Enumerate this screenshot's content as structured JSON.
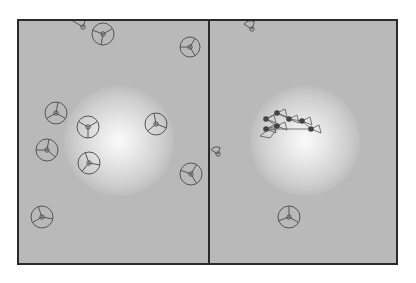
{
  "figure": {
    "background": "#ffffff",
    "panel_fill": "#b9b9b9",
    "border_color": "#2a2a2a",
    "agent_stroke": "#555555",
    "agent_dot": "#444444",
    "panels": [
      {
        "name": "left",
        "light_center": [
          100,
          120
        ],
        "agents": [
          {
            "x": 64,
            "y": 6,
            "r": 11,
            "type": "fan"
          },
          {
            "x": 84,
            "y": 13,
            "r": 11,
            "type": "circle",
            "angles": [
              200,
              100,
              330
            ]
          },
          {
            "x": 171,
            "y": 26,
            "r": 10,
            "type": "circle",
            "angles": [
              60,
              180,
              300
            ]
          },
          {
            "x": 37,
            "y": 92,
            "r": 11,
            "type": "circle",
            "angles": [
              30,
              150,
              280
            ]
          },
          {
            "x": 69,
            "y": 106,
            "r": 11,
            "type": "circle",
            "angles": [
              90,
              210,
              330
            ]
          },
          {
            "x": 137,
            "y": 103,
            "r": 11,
            "type": "circle",
            "angles": [
              20,
              140,
              260
            ]
          },
          {
            "x": 28,
            "y": 129,
            "r": 11,
            "type": "circle",
            "angles": [
              40,
              180,
              280
            ]
          },
          {
            "x": 70,
            "y": 142,
            "r": 11,
            "type": "circle",
            "angles": [
              10,
              130,
              250
            ]
          },
          {
            "x": 172,
            "y": 153,
            "r": 11,
            "type": "circle",
            "angles": [
              60,
              200,
              300
            ]
          },
          {
            "x": 23,
            "y": 196,
            "r": 11,
            "type": "circle",
            "angles": [
              10,
              150,
              250
            ]
          }
        ]
      },
      {
        "name": "right",
        "light_center": [
          95,
          120
        ],
        "agents": [
          {
            "x": 42,
            "y": 8,
            "r": 8,
            "type": "fan"
          },
          {
            "x": 8,
            "y": 133,
            "r": 7,
            "type": "fan"
          },
          {
            "x": 79,
            "y": 196,
            "r": 11,
            "type": "circle",
            "angles": [
              30,
              160,
              270
            ]
          }
        ],
        "cluster": [
          {
            "x": 56,
            "y": 98
          },
          {
            "x": 67,
            "y": 92
          },
          {
            "x": 79,
            "y": 98
          },
          {
            "x": 92,
            "y": 100
          },
          {
            "x": 101,
            "y": 108
          },
          {
            "x": 56,
            "y": 108
          },
          {
            "x": 67,
            "y": 105
          }
        ]
      }
    ]
  }
}
